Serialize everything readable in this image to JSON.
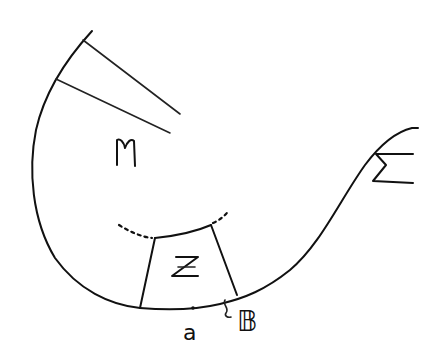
{
  "diagram": {
    "labels": {
      "M": "M",
      "Z": "Z",
      "Sigma": "Σ",
      "a": "a",
      "B": "𝔹",
      "tilde": "~"
    },
    "colors": {
      "stroke": "#111111",
      "background": "#ffffff"
    }
  }
}
